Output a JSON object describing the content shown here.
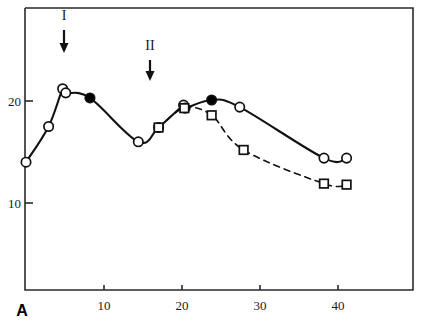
{
  "chart_data": {
    "type": "line",
    "title": "",
    "subtitle": "",
    "panel_letter": "A",
    "xlabel": "",
    "ylabel": "",
    "xlim": [
      0,
      49.5
    ],
    "ylim": [
      4.0,
      31.6
    ],
    "xticks": [
      10,
      20,
      30,
      40
    ],
    "xtick_labels": [
      "10",
      "20",
      "30",
      "40"
    ],
    "yticks": [
      10,
      20
    ],
    "ytick_labels": [
      "10",
      "20"
    ],
    "grid": false,
    "legend_position": "none",
    "frame": "box",
    "series": [
      {
        "name": "solid-curve",
        "line_style": "solid",
        "marker": "circle-open",
        "x": [
          0.0,
          2.9,
          4.7,
          5.1,
          8.2,
          14.4,
          17.0,
          20.2,
          20.4,
          23.8,
          27.4,
          38.2,
          41.1
        ],
        "y": [
          14.0,
          17.5,
          21.2,
          20.8,
          20.3,
          16.0,
          17.4,
          19.6,
          19.3,
          20.1,
          19.4,
          14.4,
          14.4
        ],
        "filled_marker_indices": [
          4,
          9
        ],
        "filled_marker_x": [
          8.2,
          23.8
        ],
        "filled_marker_y": [
          20.3,
          20.1
        ]
      },
      {
        "name": "dashed-curve",
        "line_style": "dashed",
        "marker": "square-open",
        "x": [
          17.0,
          20.3,
          23.8,
          27.9,
          38.2,
          41.1
        ],
        "y": [
          17.4,
          19.3,
          18.6,
          15.2,
          11.9,
          11.8
        ]
      }
    ],
    "annotations": [
      {
        "name": "arrow-I",
        "label": "I",
        "x": 5.0,
        "kind": "down-arrow",
        "label_y": 31.0,
        "tip_y": 26.2
      },
      {
        "name": "arrow-II",
        "label": "II",
        "x": 16.0,
        "kind": "down-arrow",
        "label_y": 27.8,
        "tip_y": 23.4
      }
    ]
  },
  "axis": {
    "x_tick_labels": [
      "10",
      "20",
      "30",
      "40"
    ],
    "y_tick_labels": [
      "20",
      "10"
    ],
    "panel_letter": "A"
  },
  "annotations": {
    "arrow_one_label": "I",
    "arrow_two_label": "II"
  },
  "colors": {
    "line": "#111111",
    "marker_fill_open": "#ffffff",
    "marker_fill_solid": "#000000",
    "text": "#1a1a1a",
    "background": "#ffffff"
  }
}
